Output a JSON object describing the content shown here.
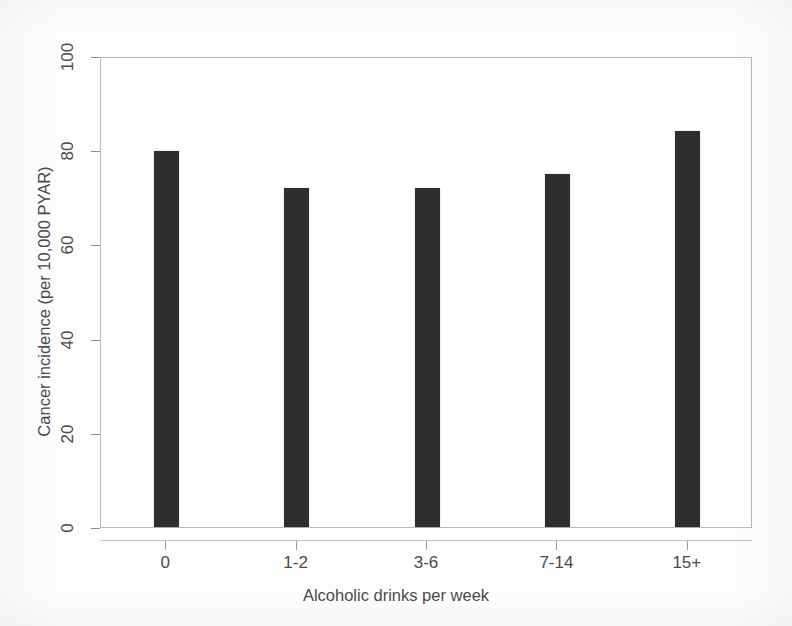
{
  "chart_data": {
    "type": "bar",
    "title": "",
    "subtitle": "",
    "xlabel": "Alcoholic drinks per week",
    "ylabel": "Cancer incidence (per 10,000 PYAR)",
    "categories": [
      "0",
      "1-2",
      "3-6",
      "7-14",
      "15+"
    ],
    "values": [
      79.8,
      72,
      72,
      75,
      84
    ],
    "ylim": [
      0,
      100
    ],
    "yticks": [
      0,
      20,
      40,
      60,
      80,
      100
    ],
    "ytick_labels": [
      "0",
      "20",
      "40",
      "60",
      "80",
      "100"
    ],
    "grid": false,
    "legend": false,
    "legend_position": "none",
    "bar_color": "#2e2e2e",
    "background_color": "#ffffff",
    "frame_color": "#b9b9b9",
    "series": [
      {
        "name": "Cancer incidence",
        "values": [
          79.8,
          72,
          72,
          75,
          84
        ]
      }
    ],
    "annotations": []
  }
}
